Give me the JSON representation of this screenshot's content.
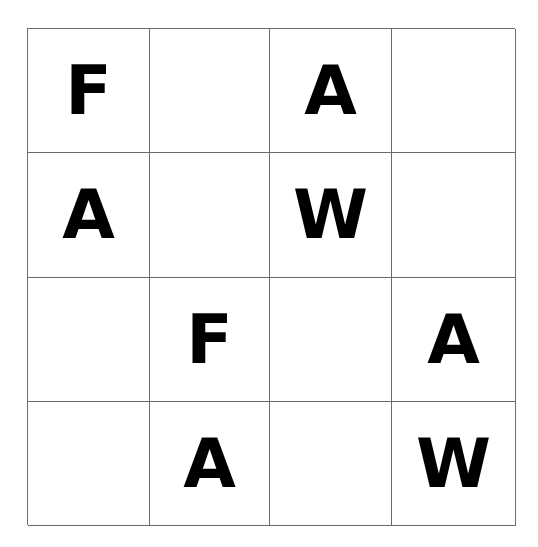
{
  "grid": {
    "rows": 4,
    "cols": 4,
    "cells": [
      [
        "F",
        "",
        "A",
        ""
      ],
      [
        "A",
        "",
        "W",
        ""
      ],
      [
        "",
        "F",
        "",
        "A"
      ],
      [
        "",
        "A",
        "",
        "W"
      ]
    ]
  }
}
